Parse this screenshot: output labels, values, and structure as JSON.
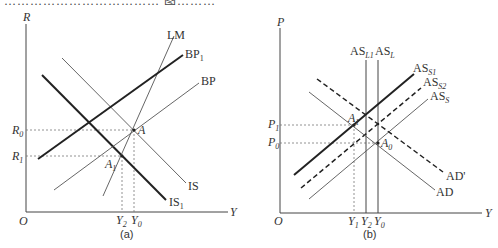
{
  "top_text_fragment": "……………………………… 图………",
  "panel_a": {
    "caption": "(a)",
    "axes": {
      "y_label": "R",
      "x_label": "Y",
      "origin_label": "O"
    },
    "y_ticks": [
      {
        "label": "R",
        "sub": "0"
      },
      {
        "label": "R",
        "sub": "1"
      }
    ],
    "x_ticks": [
      {
        "label": "Y",
        "sub": "2"
      },
      {
        "label": "Y",
        "sub": "0"
      }
    ],
    "curves": {
      "LM": "LM",
      "BP1": {
        "label": "BP",
        "sub": "1"
      },
      "BP": "BP",
      "IS": "IS",
      "IS1": {
        "label": "IS",
        "sub": "1"
      }
    },
    "points": {
      "A": "A",
      "A1": {
        "label": "A",
        "sub": "1"
      }
    }
  },
  "panel_b": {
    "caption": "(b)",
    "axes": {
      "y_label": "P",
      "x_label": "Y",
      "origin_label": "O"
    },
    "y_ticks": [
      {
        "label": "P",
        "sub": "1"
      },
      {
        "label": "P",
        "sub": "0"
      }
    ],
    "x_ticks": [
      {
        "label": "Y",
        "sub": "1"
      },
      {
        "label": "Y",
        "sub": "2"
      },
      {
        "label": "Y",
        "sub": "0"
      }
    ],
    "curves": {
      "ASL1": {
        "label": "AS",
        "sub": "L1"
      },
      "ASL": {
        "label": "AS",
        "sub": "L"
      },
      "ASS1": {
        "label": "AS",
        "sub": "S1"
      },
      "ASS2": {
        "label": "AS",
        "sub": "S2"
      },
      "ASS": {
        "label": "AS",
        "sub": "S"
      },
      "AD": "AD",
      "ADp": "AD'"
    },
    "points": {
      "A1": {
        "label": "A",
        "sub": "1"
      },
      "A0": {
        "label": "A",
        "sub": "0"
      }
    }
  },
  "colors": {
    "line": "#333333",
    "thin": "#555555",
    "dotted": "#777777"
  }
}
